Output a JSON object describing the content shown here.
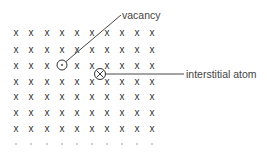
{
  "diagram": {
    "lattice": {
      "columns": 10,
      "full_rows": 7,
      "partial_row_marker": "·",
      "atom_marker": "x",
      "col_x": [
        16,
        31,
        47,
        62,
        77,
        92,
        107,
        122,
        137,
        152
      ],
      "row_y": [
        32,
        49,
        65,
        81,
        96,
        112,
        128
      ],
      "partial_row_y": 144,
      "vacancy_position": {
        "row": 2,
        "col": 3
      }
    },
    "defects": {
      "vacancy": {
        "label": "vacancy",
        "circle": {
          "cx": 62,
          "cy": 65,
          "r": 5
        },
        "leader_end": {
          "x": 121,
          "y": 15
        },
        "label_pos": {
          "x": 122,
          "y": 19
        }
      },
      "interstitial": {
        "label": "interstitial atom",
        "circle": {
          "cx": 100,
          "cy": 74,
          "r": 5.5
        },
        "leader_end": {
          "x": 184,
          "y": 74
        },
        "label_pos": {
          "x": 186,
          "y": 78
        }
      }
    },
    "colors": {
      "atom": "#333333",
      "line": "#333333",
      "label": "#444444",
      "background": "#ffffff"
    }
  }
}
